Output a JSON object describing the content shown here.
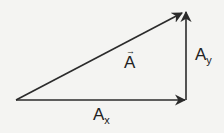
{
  "diagram": {
    "type": "vector-components",
    "colors": {
      "arrow": "#2b2b2b",
      "background": "#f4f4f2",
      "text": "#222222"
    },
    "vectors": [
      {
        "id": "A",
        "label": "A",
        "has_vector_arrow": true,
        "from": [
          16,
          100
        ],
        "to": [
          184,
          12
        ]
      },
      {
        "id": "Ax",
        "label": "A",
        "subscript": "x",
        "from": [
          16,
          100
        ],
        "to": [
          186,
          100
        ]
      },
      {
        "id": "Ay",
        "label": "A",
        "subscript": "y",
        "from": [
          186,
          100
        ],
        "to": [
          186,
          12
        ]
      }
    ],
    "labels": {
      "resultant": {
        "text": "A",
        "arrow_glyph": "→"
      },
      "x_component": {
        "text": "A",
        "sub": "x"
      },
      "y_component": {
        "text": "A",
        "sub": "y"
      }
    }
  }
}
